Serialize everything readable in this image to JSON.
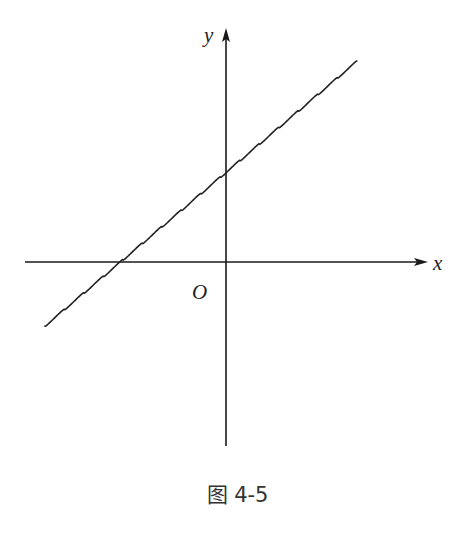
{
  "figure": {
    "caption": "图 4-5",
    "axes": {
      "x_label": "x",
      "y_label": "y",
      "origin_label": "O",
      "origin_px": [
        226,
        262
      ],
      "x_axis_px": {
        "x_start": 25,
        "x_end": 428,
        "y": 262
      },
      "y_axis_px": {
        "x": 226,
        "y_start": 446,
        "y_end": 28
      }
    },
    "curve": {
      "description": "wavy line with positive slope, crossing negative x-axis and positive y-axis",
      "start_px": [
        45,
        326
      ],
      "end_px": [
        355,
        63
      ],
      "wave_period_px": 19.5,
      "wave_amplitude_px": 3.2,
      "color": "#222222"
    }
  },
  "chart_data": {
    "type": "line",
    "title": "图 4-5",
    "xlabel": "x",
    "ylabel": "y",
    "origin_label": "O",
    "series": [
      {
        "name": "wavy line",
        "description": "increasing line with small periodic oscillation; x-intercept negative, y-intercept positive",
        "x_intercept_px": 122,
        "y_intercept_px": 172
      }
    ],
    "grid": false
  }
}
